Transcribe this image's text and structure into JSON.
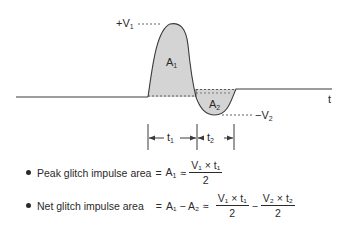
{
  "diagram": {
    "title": "Glitch impulse area",
    "axis_label": "t",
    "labels": {
      "peak_pos": {
        "prefix": "+V",
        "sub": "1"
      },
      "peak_neg": {
        "prefix": "−V",
        "sub": "2"
      },
      "area1": {
        "main": "A",
        "sub": "1"
      },
      "area2": {
        "main": "A",
        "sub": "2"
      },
      "t1": {
        "main": "t",
        "sub": "1"
      },
      "t2": {
        "main": "t",
        "sub": "2"
      }
    },
    "colors": {
      "line": "#3a3a3a",
      "fill": "#d4d4d4",
      "text": "#2a2a2a"
    }
  },
  "formulas": [
    {
      "label": "Peak glitch impulse area",
      "eq1": "=",
      "lhs": {
        "main": "A",
        "sub": "1"
      },
      "eq2": "≈",
      "fraction": {
        "num": "V₁ × t₁",
        "den": "2"
      }
    },
    {
      "label": "Net glitch impulse area",
      "eq1": "=",
      "lhs": "A₁ − A₂",
      "eq2": "≈",
      "fraction1": {
        "num": "V₁ × t₁",
        "den": "2"
      },
      "minus": "−",
      "fraction2": {
        "num": "V₂ × t₂",
        "den": "2"
      }
    }
  ]
}
